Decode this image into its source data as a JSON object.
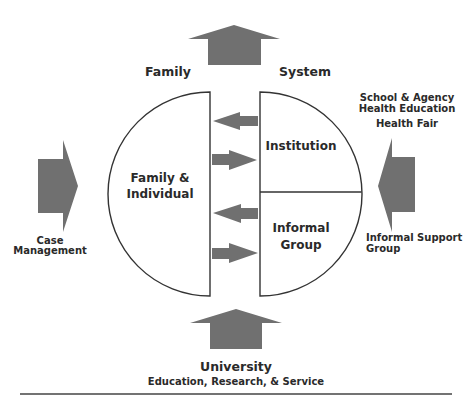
{
  "diagram": {
    "colors": {
      "arrow_fill": "#707070",
      "stroke": "#333333",
      "text": "#2a2a2a",
      "background": "#ffffff"
    },
    "header_labels": {
      "left": "Family",
      "right": "System"
    },
    "left_node": {
      "line1": "Family &",
      "line2": "Individual"
    },
    "right_node": {
      "top": {
        "label": "Institution"
      },
      "bottom": {
        "line1": "Informal",
        "line2": "Group"
      }
    },
    "left_input": {
      "line1": "Case",
      "line2": "Management"
    },
    "right_input": {
      "top_line1": "School & Agency",
      "top_line2": "Health Education",
      "top_line3": "Health Fair",
      "bottom_line1": "Informal Support",
      "bottom_line2": "Group"
    },
    "bottom_source": {
      "title": "University",
      "subtitle": "Education, Research, & Service"
    },
    "arrows": [
      {
        "id": "top-up",
        "direction": "up"
      },
      {
        "id": "bottom-up",
        "direction": "up"
      },
      {
        "id": "left-right",
        "direction": "right"
      },
      {
        "id": "right-left",
        "direction": "left"
      },
      {
        "id": "exchange-1",
        "direction": "left"
      },
      {
        "id": "exchange-2",
        "direction": "right"
      },
      {
        "id": "exchange-3",
        "direction": "left"
      },
      {
        "id": "exchange-4",
        "direction": "right"
      }
    ]
  }
}
